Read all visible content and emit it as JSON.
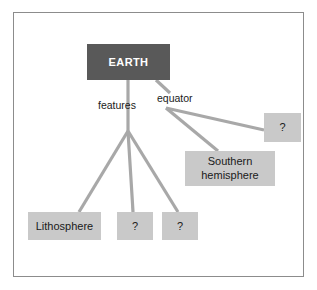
{
  "diagram": {
    "type": "concept-map",
    "title_node": "EARTH",
    "background_color": "#ffffff",
    "frame_color": "#8c8c8c",
    "root_fill": "#595959",
    "root_text_color": "#ffffff",
    "box_fill": "#c9c9c9",
    "box_text_color": "#1a1a1a",
    "edge_color": "#a8a8a8",
    "nodes": [
      {
        "id": "earth",
        "label": "EARTH",
        "kind": "root",
        "x": 87,
        "y": 44,
        "w": 83,
        "h": 36
      },
      {
        "id": "right-unknown",
        "label": "?",
        "kind": "unknown",
        "x": 264,
        "y": 113,
        "w": 37,
        "h": 29
      },
      {
        "id": "southern-hemisphere",
        "label": "Southern hemisphere",
        "line1": "Southern",
        "line2": "hemisphere",
        "kind": "box",
        "x": 185,
        "y": 151,
        "w": 90,
        "h": 35
      },
      {
        "id": "lithosphere",
        "label": "Lithosphere",
        "kind": "box",
        "x": 28,
        "y": 212,
        "w": 73,
        "h": 28
      },
      {
        "id": "feature-unknown-1",
        "label": "?",
        "kind": "unknown",
        "x": 117,
        "y": 212,
        "w": 36,
        "h": 28
      },
      {
        "id": "feature-unknown-2",
        "label": "?",
        "kind": "unknown",
        "x": 162,
        "y": 212,
        "w": 36,
        "h": 28
      }
    ],
    "edge_labels": [
      {
        "id": "features",
        "text": "features",
        "x": 98,
        "y": 99
      },
      {
        "id": "equator",
        "text": "equator",
        "x": 157,
        "y": 92
      }
    ]
  }
}
